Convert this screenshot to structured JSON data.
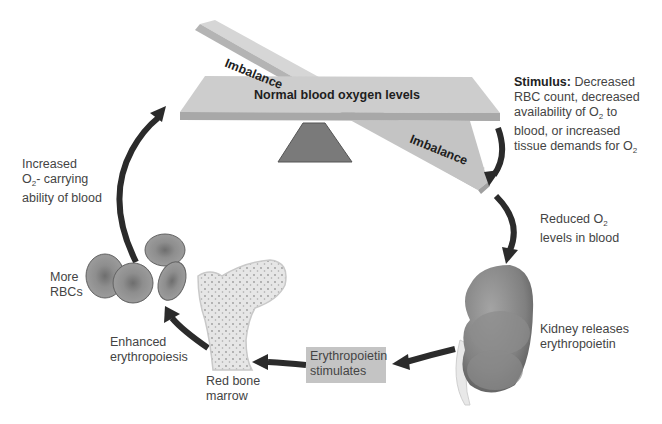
{
  "balance": {
    "center_label": "Normal blood oxygen levels",
    "imbalance_top_label": "Imbalance",
    "imbalance_bottom_label": "Imbalance"
  },
  "stimulus": {
    "title": "Stimulus:",
    "line1_rest": " Decreased",
    "line2": "RBC count, decreased",
    "line3_pre": "availability of O",
    "line3_sub": "2",
    "line3_post": " to",
    "line4": "blood, or  increased",
    "line5_pre": "tissue demands for O",
    "line5_sub": "2"
  },
  "reduced": {
    "line1_pre": "Reduced O",
    "line1_sub": "2",
    "line2": "levels in blood"
  },
  "kidney": {
    "line1": "Kidney releases",
    "line2": "erythropoietin"
  },
  "epo": {
    "line1": "Erythropoietin",
    "line2": "stimulates"
  },
  "marrow": {
    "line1": "Red bone",
    "line2": "marrow"
  },
  "erythropoiesis": {
    "line1": "Enhanced",
    "line2": "erythropoiesis"
  },
  "rbcs": {
    "line1": "More",
    "line2": "RBCs"
  },
  "increased": {
    "line1": "Increased",
    "line2_pre": "O",
    "line2_sub": "2",
    "line2_post": "- carrying",
    "line3": "ability of blood"
  },
  "colors": {
    "beam": "#c8c8c8",
    "fulcrum": "#7a7a7a",
    "arrow": "#2b2b2b",
    "kidney": "#858585",
    "rbc": "#8a8a8a",
    "epo_box": "#c4c4c4"
  }
}
